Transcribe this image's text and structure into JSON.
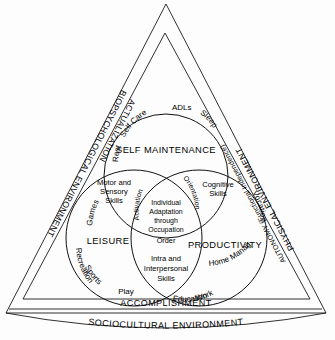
{
  "diagram": {
    "outer_triangle": {
      "left_label": "BIOPSYCHOLOGICAL ENVIRONMENT",
      "right_label": "PHYSICAL ENVIRONMENT",
      "bottom_label": "SOCIOCULTURAL ENVIRONMENT"
    },
    "inner_triangle": {
      "left_label": "ACTUALIZATION",
      "right_label": "AUTONOMY (Functional Independence)",
      "bottom_label": "ACCOMPLISHMENT"
    },
    "circles": [
      {
        "id": "self-maintenance",
        "label": "SELF MAINTENANCE",
        "items": [
          "Rest",
          "Self Care",
          "ADLs",
          "Sleep"
        ]
      },
      {
        "id": "leisure",
        "label": "LEISURE",
        "items": [
          "Games",
          "Recreation",
          "Sports",
          "Play"
        ]
      },
      {
        "id": "productivity",
        "label": "PRODUCTIVITY",
        "items": [
          "Vocation",
          "Home Management",
          "Education",
          "Work"
        ]
      }
    ],
    "intersections": {
      "self_leisure": "Motor and Sensory Skills",
      "self_productivity": "Cognitive Skills",
      "leisure_productivity": "Intra and Interpersonal Skills",
      "lens_left": "Activation",
      "lens_right": "Orientation",
      "lens_bottom": "Order"
    },
    "center": {
      "line1": "Individual",
      "line2": "Adaptation",
      "line3": "through",
      "line4": "Occupation"
    },
    "colors": {
      "stroke": "#111111",
      "background": "#ffffff",
      "text": "#000000"
    }
  }
}
